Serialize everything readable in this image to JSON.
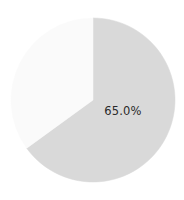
{
  "chart_data": {
    "type": "pie",
    "title": "",
    "subtitle": "",
    "xlabel": "",
    "ylabel": "",
    "grid": false,
    "legend": false,
    "legend_position": "none",
    "start_angle_deg": 90,
    "direction": "clockwise",
    "center": {
      "x": 93,
      "y": 100
    },
    "radius": 82,
    "labels": [
      "",
      ""
    ],
    "values": [
      65.0,
      35.0
    ],
    "value_labels": [
      "65.0%",
      ""
    ],
    "colors": [
      "#d9d9d9",
      "#fafafa"
    ],
    "slices": [
      {
        "name": "major-slice",
        "value": 65.0,
        "value_label": "65.0%",
        "color": "#d9d9d9",
        "start_deg": 0,
        "sweep_deg": 234,
        "label_x": 123,
        "label_y": 111,
        "labelled": true
      },
      {
        "name": "minor-slice",
        "value": 35.0,
        "value_label": "",
        "color": "#fafafa",
        "start_deg": 234,
        "sweep_deg": 126,
        "label_x": 57,
        "label_y": 66,
        "labelled": false
      }
    ]
  },
  "figure": {
    "background_color": "#ffffff",
    "label_text_color": "#2a2a2a",
    "width": 184,
    "height": 200
  }
}
